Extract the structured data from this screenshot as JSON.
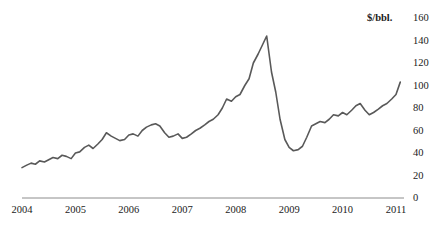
{
  "chart_data": {
    "type": "line",
    "title": "",
    "subtitle": "",
    "xlabel": "",
    "ylabel": "",
    "unit_label": "$/bbl.",
    "grid": false,
    "legend": "none",
    "y_axis_position": "right",
    "xlim": [
      2004.0,
      2011.15
    ],
    "ylim": [
      0,
      160
    ],
    "yticks": [
      0,
      20,
      40,
      60,
      80,
      100,
      120,
      140,
      160
    ],
    "ytick_labels": [
      "0",
      "20",
      "40",
      "60",
      "80",
      "100",
      "120",
      "140",
      "160"
    ],
    "xticks": [
      2004,
      2005,
      2006,
      2007,
      2008,
      2009,
      2010,
      2011
    ],
    "xtick_labels": [
      "2004",
      "2005",
      "2006",
      "2007",
      "2008",
      "2009",
      "2010",
      "2011"
    ],
    "series": [
      {
        "name": "Crude oil price",
        "color": "#595959",
        "x": [
          2004.0,
          2004.08,
          2004.17,
          2004.25,
          2004.33,
          2004.42,
          2004.5,
          2004.58,
          2004.67,
          2004.75,
          2004.83,
          2004.92,
          2005.0,
          2005.08,
          2005.17,
          2005.25,
          2005.33,
          2005.42,
          2005.5,
          2005.58,
          2005.67,
          2005.75,
          2005.83,
          2005.92,
          2006.0,
          2006.08,
          2006.17,
          2006.25,
          2006.33,
          2006.42,
          2006.5,
          2006.58,
          2006.67,
          2006.75,
          2006.83,
          2006.92,
          2007.0,
          2007.08,
          2007.17,
          2007.25,
          2007.33,
          2007.42,
          2007.5,
          2007.58,
          2007.67,
          2007.75,
          2007.83,
          2007.92,
          2008.0,
          2008.08,
          2008.17,
          2008.25,
          2008.33,
          2008.42,
          2008.5,
          2008.58,
          2008.67,
          2008.75,
          2008.83,
          2008.92,
          2009.0,
          2009.08,
          2009.17,
          2009.25,
          2009.33,
          2009.42,
          2009.5,
          2009.58,
          2009.67,
          2009.75,
          2009.83,
          2009.92,
          2010.0,
          2010.08,
          2010.17,
          2010.25,
          2010.33,
          2010.42,
          2010.5,
          2010.58,
          2010.67,
          2010.75,
          2010.83,
          2010.92,
          2011.0,
          2011.08
        ],
        "values": [
          27,
          29,
          31,
          30,
          33,
          32,
          34,
          36,
          35,
          38,
          37,
          35,
          40,
          41,
          45,
          47,
          44,
          48,
          52,
          58,
          55,
          53,
          51,
          52,
          56,
          57,
          55,
          60,
          63,
          65,
          66,
          64,
          58,
          54,
          55,
          57,
          53,
          54,
          57,
          60,
          62,
          65,
          68,
          70,
          74,
          80,
          88,
          86,
          90,
          92,
          100,
          106,
          120,
          128,
          136,
          144,
          112,
          94,
          70,
          52,
          45,
          42,
          43,
          46,
          54,
          64,
          66,
          68,
          67,
          70,
          74,
          73,
          76,
          74,
          78,
          82,
          84,
          78,
          74,
          76,
          79,
          82,
          84,
          88,
          92,
          103
        ]
      }
    ],
    "annotations": [
      {
        "label": "peak",
        "x": 2008.58,
        "y": 144
      },
      {
        "label": "trough",
        "x": 2009.08,
        "y": 42
      }
    ]
  },
  "axis": {
    "unit_label": "$/bbl."
  }
}
